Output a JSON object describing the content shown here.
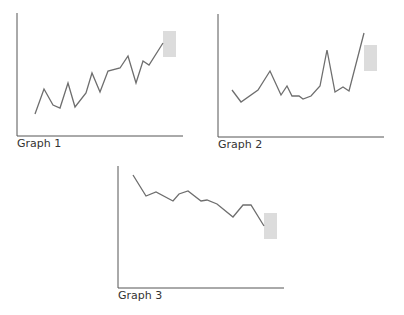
{
  "chart_data": [
    {
      "type": "line",
      "title": "Graph 1",
      "xlabel": "",
      "ylabel": "",
      "grid": false,
      "axes_px": {
        "x0": 17,
        "y0": 136,
        "x1": 183,
        "ytop": 13
      },
      "points_px": [
        [
          35,
          114
        ],
        [
          44,
          89
        ],
        [
          53,
          105
        ],
        [
          60,
          108
        ],
        [
          68,
          83
        ],
        [
          75,
          107
        ],
        [
          86,
          93
        ],
        [
          92,
          73
        ],
        [
          100,
          92
        ],
        [
          108,
          71
        ],
        [
          120,
          68
        ],
        [
          128,
          56
        ],
        [
          136,
          83
        ],
        [
          143,
          61
        ],
        [
          149,
          65
        ],
        [
          163,
          43
        ]
      ],
      "highlight_box_px": {
        "x": 163,
        "y": 31,
        "w": 13,
        "h": 26
      },
      "trend": "increasing"
    },
    {
      "type": "line",
      "title": "Graph 2",
      "xlabel": "",
      "ylabel": "",
      "grid": false,
      "axes_px": {
        "x0": 218,
        "y0": 137,
        "x1": 384,
        "ytop": 14
      },
      "points_px": [
        [
          232,
          90
        ],
        [
          241,
          102
        ],
        [
          258,
          90
        ],
        [
          270,
          71
        ],
        [
          281,
          95
        ],
        [
          287,
          86
        ],
        [
          292,
          96
        ],
        [
          299,
          96
        ],
        [
          303,
          99
        ],
        [
          311,
          96
        ],
        [
          320,
          86
        ],
        [
          327,
          50
        ],
        [
          335,
          92
        ],
        [
          343,
          87
        ],
        [
          349,
          91
        ],
        [
          364,
          33
        ]
      ],
      "highlight_box_px": {
        "x": 364,
        "y": 45,
        "w": 13,
        "h": 26
      },
      "trend": "flat with spikes"
    },
    {
      "type": "line",
      "title": "Graph 3",
      "xlabel": "",
      "ylabel": "",
      "grid": false,
      "axes_px": {
        "x0": 118,
        "y0": 288,
        "x1": 284,
        "ytop": 166
      },
      "points_px": [
        [
          133,
          175
        ],
        [
          146,
          196
        ],
        [
          156,
          192
        ],
        [
          173,
          201
        ],
        [
          179,
          194
        ],
        [
          188,
          191
        ],
        [
          201,
          201
        ],
        [
          207,
          200
        ],
        [
          217,
          204
        ],
        [
          233,
          217
        ],
        [
          243,
          205
        ],
        [
          251,
          205
        ],
        [
          264,
          226
        ]
      ],
      "highlight_box_px": {
        "x": 264,
        "y": 213,
        "w": 13,
        "h": 26
      },
      "trend": "decreasing"
    }
  ],
  "labels": {
    "graph1": "Graph 1",
    "graph2": "Graph 2",
    "graph3": "Graph 3"
  },
  "colors": {
    "axis": "#555555",
    "line": "#6e6e6e",
    "highlight": "#dcdcdc",
    "text": "#333333"
  }
}
